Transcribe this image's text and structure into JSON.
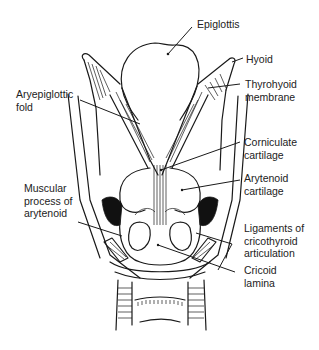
{
  "figure": {
    "type": "anatomical line drawing"
  },
  "labels": [
    {
      "id": "epiglottis",
      "text": "Epiglottis"
    },
    {
      "id": "hyoid",
      "text": "Hyoid"
    },
    {
      "id": "thyrohyoid",
      "text": "Thyrohyoid\nmembrane"
    },
    {
      "id": "aryepiglottic",
      "text": "Aryepiglottic\nfold"
    },
    {
      "id": "corniculate",
      "text": "Corniculate\ncartilage"
    },
    {
      "id": "arytenoid",
      "text": "Arytenoid\ncartilage"
    },
    {
      "id": "muscular_process",
      "text": "Muscular\nprocess of\narytenoid"
    },
    {
      "id": "ligaments",
      "text": "Ligaments of\ncricothyroid\narticulation"
    },
    {
      "id": "cricoid",
      "text": "Cricoid\nlamina"
    }
  ],
  "colors": {
    "ink": "#1a1a1a",
    "background": "#ffffff"
  }
}
